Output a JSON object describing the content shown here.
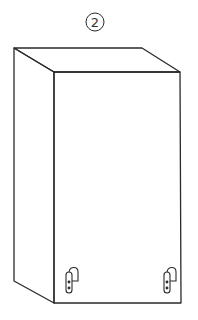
{
  "figure": {
    "label": "2",
    "label_style": "circled",
    "stroke_color": "#2a2a2a",
    "background": "#ffffff",
    "hinges": [
      {
        "name": "left-hinge"
      },
      {
        "name": "right-hinge"
      }
    ]
  }
}
